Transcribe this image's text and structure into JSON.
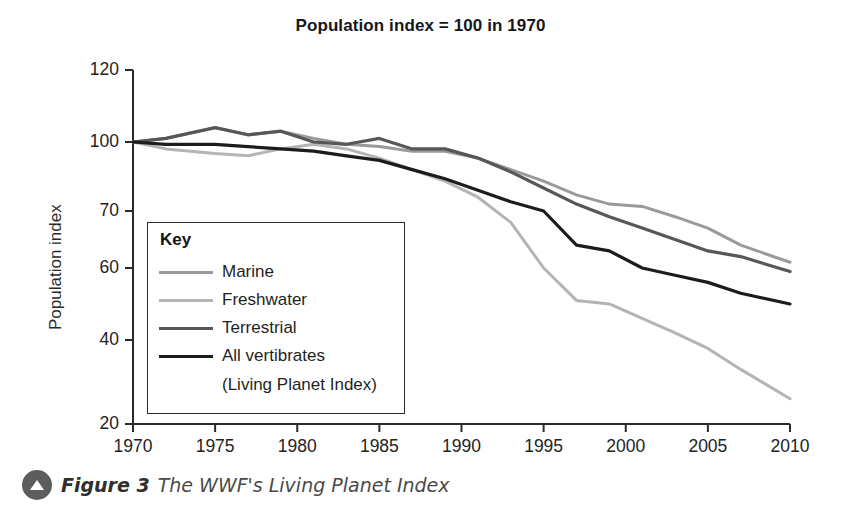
{
  "chart_data": {
    "type": "line",
    "title": "Population index = 100 in 1970",
    "xlabel": "",
    "ylabel": "Population index",
    "xlim": [
      1970,
      2010
    ],
    "ylim": [
      20,
      120
    ],
    "grid": false,
    "legend_position": "inside-left",
    "xticks": [
      "1970",
      "1975",
      "1980",
      "1985",
      "1990",
      "1995",
      "2000",
      "2005",
      "2010"
    ],
    "xtick_values": [
      1970,
      1975,
      1980,
      1985,
      1990,
      1995,
      2000,
      2005,
      2010
    ],
    "yticks": [
      "120",
      "100",
      "70",
      "60",
      "40",
      "20"
    ],
    "ytick_values": [
      120,
      100,
      70,
      60,
      40,
      20
    ],
    "ytick_pixel_fractions": [
      0.0,
      0.2034,
      0.3983,
      0.5593,
      0.7627,
      1.0
    ],
    "series": [
      {
        "name": "Marine",
        "color": "#9a9a9a",
        "width": 3.0,
        "x": [
          1970,
          1972,
          1975,
          1977,
          1979,
          1981,
          1983,
          1985,
          1987,
          1989,
          1991,
          1993,
          1995,
          1997,
          1999,
          2001,
          2003,
          2005,
          2007,
          2010
        ],
        "values": [
          100,
          101,
          104,
          102,
          103,
          101,
          99,
          98,
          96,
          96,
          93,
          88,
          83,
          77,
          73,
          72,
          69,
          67,
          64,
          61
        ]
      },
      {
        "name": "Freshwater",
        "color": "#b4b4b4",
        "width": 3.0,
        "x": [
          1970,
          1972,
          1975,
          1977,
          1979,
          1981,
          1983,
          1985,
          1987,
          1989,
          1991,
          1993,
          1995,
          1997,
          1999,
          2001,
          2003,
          2005,
          2007,
          2010
        ],
        "values": [
          100,
          97,
          95,
          94,
          97,
          99,
          97,
          93,
          88,
          83,
          76,
          68,
          60,
          51,
          50,
          46,
          42,
          38,
          33,
          26
        ]
      },
      {
        "name": "Terrestrial",
        "color": "#575757",
        "width": 3.2,
        "x": [
          1970,
          1972,
          1975,
          1977,
          1979,
          1981,
          1983,
          1985,
          1987,
          1989,
          1991,
          1993,
          1995,
          1997,
          1999,
          2001,
          2003,
          2005,
          2007,
          2010
        ],
        "values": [
          100,
          101,
          104,
          102,
          103,
          100,
          99,
          101,
          97,
          97,
          93,
          87,
          80,
          73,
          69,
          67,
          65,
          63,
          62,
          59
        ]
      },
      {
        "name": "All vertibrates",
        "color": "#1c1c1c",
        "width": 3.2,
        "x": [
          1970,
          1972,
          1975,
          1977,
          1979,
          1981,
          1983,
          1985,
          1987,
          1989,
          1991,
          1993,
          1995,
          1997,
          1999,
          2001,
          2003,
          2005,
          2007,
          2010
        ],
        "values": [
          100,
          99,
          99,
          98,
          97,
          96,
          94,
          92,
          88,
          84,
          79,
          74,
          70,
          64,
          63,
          60,
          58,
          56,
          53,
          50
        ]
      }
    ]
  },
  "legend": {
    "title": "Key",
    "entries": [
      {
        "label": "Marine"
      },
      {
        "label": "Freshwater"
      },
      {
        "label": "Terrestrial"
      },
      {
        "label": "All vertibrates"
      }
    ],
    "subtitle": "(Living Planet Index)"
  },
  "caption": {
    "icon": "circle-up-triangle-icon",
    "figure_number": "Figure 3",
    "text": "The WWF's Living Planet Index"
  },
  "colors": {
    "marine": "#9a9a9a",
    "freshwater": "#b4b4b4",
    "terrestrial": "#575757",
    "all_vertibrates": "#1c1c1c",
    "axis": "#2b2b2b"
  }
}
